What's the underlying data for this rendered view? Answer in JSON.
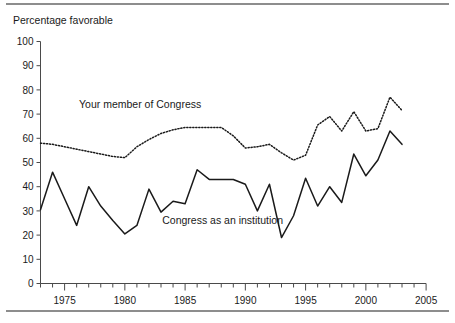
{
  "figure": {
    "axis_title": "Percentage favorable",
    "rule_color": "#8d8d8d",
    "line_color": "#1a1a1a"
  },
  "chart_data": {
    "type": "line",
    "title": "",
    "subtitle": "",
    "xlabel": "",
    "ylabel": "Percentage favorable",
    "xlim": [
      1973,
      2005
    ],
    "ylim": [
      0,
      100
    ],
    "grid": false,
    "legend_position": "inline-annotation",
    "y_ticks": [
      0,
      10,
      20,
      30,
      40,
      50,
      60,
      70,
      80,
      90,
      100
    ],
    "y_tick_labels": [
      "0",
      "10",
      "20",
      "30",
      "40",
      "50",
      "60",
      "70",
      "80",
      "90",
      "100"
    ],
    "x_ticks": [
      1975,
      1980,
      1985,
      1990,
      1995,
      2000,
      2005
    ],
    "x_tick_labels": [
      "1975",
      "1980",
      "1985",
      "1990",
      "1995",
      "2000",
      "2005"
    ],
    "x_minor_tick_interval": 1,
    "x": [
      1973,
      1974,
      1975,
      1976,
      1977,
      1978,
      1979,
      1980,
      1981,
      1982,
      1983,
      1984,
      1985,
      1986,
      1987,
      1988,
      1989,
      1990,
      1991,
      1992,
      1993,
      1994,
      1995,
      1996,
      1997,
      1998,
      1999,
      2000,
      2001,
      2002,
      2003
    ],
    "series": [
      {
        "name": "Your member of Congress",
        "style": "dotted",
        "label_x": 1976.2,
        "label_y": 72.5,
        "values": [
          58,
          57.5,
          56.5,
          55.5,
          54.5,
          53.5,
          52.5,
          52,
          56.5,
          59.5,
          62,
          63.5,
          64.5,
          64.5,
          64.5,
          64.5,
          61,
          56,
          56.5,
          57.5,
          54,
          51,
          53,
          65.5,
          69,
          63,
          71,
          63,
          64,
          77,
          71.5
        ]
      },
      {
        "name": "Congress as an institution",
        "style": "solid",
        "label_x": 1983.1,
        "label_y": 24.5,
        "values": [
          30.5,
          46,
          35,
          24,
          40,
          32,
          26,
          20.5,
          24,
          39,
          29.5,
          34,
          33,
          47,
          43,
          43,
          43,
          41,
          30,
          41,
          19,
          28,
          43.5,
          32,
          40,
          33.5,
          53.5,
          44.5,
          51,
          63,
          57.5
        ]
      }
    ]
  }
}
